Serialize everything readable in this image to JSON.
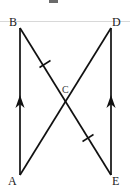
{
  "figure": {
    "type": "geometry-diagram",
    "canvas": {
      "width": 130,
      "height": 193
    },
    "stroke_color": "#111111",
    "rule_color": "#d8d8d8",
    "points": [
      {
        "id": "B",
        "label": "B",
        "x": 20,
        "y": 28,
        "label_x": 9,
        "label_y": 17
      },
      {
        "id": "D",
        "label": "D",
        "x": 111,
        "y": 28,
        "label_x": 112,
        "label_y": 17
      },
      {
        "id": "A",
        "label": "A",
        "x": 20,
        "y": 175,
        "label_x": 8,
        "label_y": 176
      },
      {
        "id": "E",
        "label": "E",
        "x": 111,
        "y": 175,
        "label_x": 112,
        "label_y": 176
      },
      {
        "id": "C",
        "label": "C",
        "x": 67,
        "y": 101,
        "label_x": 62,
        "label_y": 85
      }
    ],
    "segments": [
      {
        "id": "AB",
        "from": "A",
        "to": "B",
        "arrow": "up",
        "ticks": 0,
        "note": "left vertical side, single arrowhead pointing up"
      },
      {
        "id": "ED",
        "from": "E",
        "to": "D",
        "arrow": "up",
        "ticks": 0,
        "note": "right vertical side, single arrowhead pointing up"
      },
      {
        "id": "BE",
        "from": "B",
        "to": "E",
        "arrow": "none",
        "ticks": 2,
        "note": "diagonal from top-left to bottom-right with two congruence tick marks"
      },
      {
        "id": "AD",
        "from": "A",
        "to": "D",
        "arrow": "none",
        "ticks": 0,
        "note": "diagonal from bottom-left to top-right"
      }
    ],
    "tick_marks": [
      {
        "on": "BE",
        "x": 45,
        "y": 64,
        "label": "congruence-tick-upper"
      },
      {
        "on": "BE",
        "x": 88,
        "y": 138,
        "label": "congruence-tick-lower"
      }
    ],
    "arrow_marks": [
      {
        "on": "AB",
        "x": 20,
        "y": 102,
        "direction": "up"
      },
      {
        "on": "ED",
        "x": 111,
        "y": 102,
        "direction": "up"
      }
    ],
    "annotations": {
      "top_rule": "horizontal-rule",
      "top_artifact": "cropped-text-fragment"
    }
  }
}
